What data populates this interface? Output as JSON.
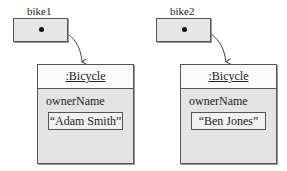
{
  "references": [
    {
      "name": "bike1",
      "points_to": 0
    },
    {
      "name": "bike2",
      "points_to": 1
    }
  ],
  "objects": [
    {
      "class_label": ":Bicycle",
      "field_name": "ownerName",
      "field_value": "“Adam Smith”"
    },
    {
      "class_label": ":Bicycle",
      "field_name": "ownerName",
      "field_value": "“Ben Jones”"
    }
  ],
  "colors": {
    "box_fill": "#e6e6e6",
    "header_fill": "#fafafa",
    "border": "#555555"
  }
}
